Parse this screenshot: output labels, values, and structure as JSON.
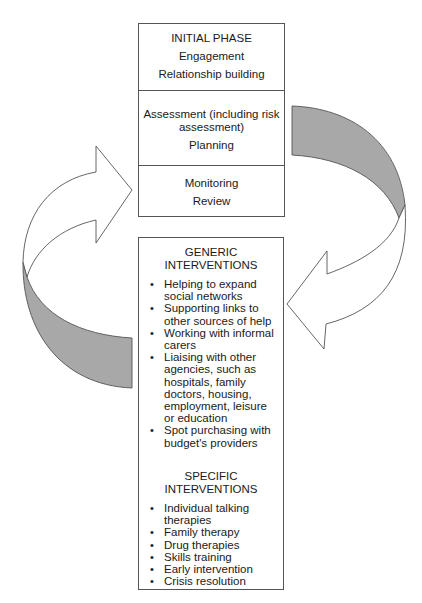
{
  "phase_box": {
    "initial": {
      "title": "INITIAL PHASE",
      "lines": [
        "Engagement",
        "Relationship building"
      ]
    },
    "assessment": {
      "lines": [
        "Assessment (including risk",
        "assessment)",
        "Planning"
      ]
    },
    "monitoring": {
      "lines": [
        "Monitoring",
        "Review"
      ]
    }
  },
  "interventions_box": {
    "generic": {
      "heading": [
        "GENERIC",
        "INTERVENTIONS"
      ],
      "items": [
        "Helping to expand social networks",
        "Supporting links to other sources of help",
        "Working with informal carers",
        "Liaising with other agencies, such as hospitals, family doctors, housing, employment, leisure or education",
        "Spot purchasing with budget's providers"
      ]
    },
    "specific": {
      "heading": [
        "SPECIFIC",
        "INTERVENTIONS"
      ],
      "items": [
        "Individual talking therapies",
        "Family therapy",
        "Drug therapies",
        "Skills training",
        "Early intervention",
        "Crisis resolution"
      ]
    }
  },
  "colors": {
    "band_fill": "#a8a8a8",
    "stroke": "#555555",
    "arrow_fill": "#ffffff"
  }
}
